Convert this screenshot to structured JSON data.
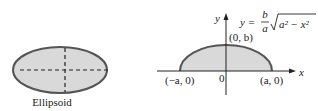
{
  "left_figure": {
    "caption": "Ellipsoid",
    "fill_color": "#d9d9d9",
    "stroke_color": "#555555"
  },
  "right_figure": {
    "equation": {
      "lhs": "y =",
      "numerator": "b",
      "denominator": "a",
      "radicand": "a² − x²"
    },
    "axis_labels": {
      "x": "x",
      "y": "y"
    },
    "points": {
      "top": "(0, b)",
      "left": "(−a, 0)",
      "right": "(a, 0)",
      "origin": "0"
    },
    "fill_color": "#d9d9d9",
    "stroke_color": "#555555"
  }
}
